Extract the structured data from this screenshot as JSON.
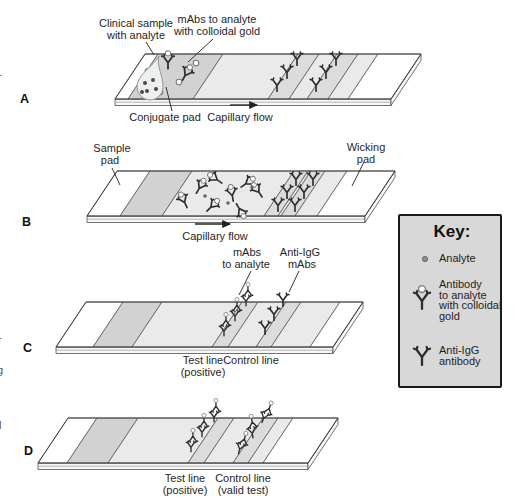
{
  "figure": {
    "panel_a": {
      "letter": "A",
      "clinical_sample_line1": "Clinical sample",
      "clinical_sample_line2": "with analyte",
      "mabs_gold_line1": "mAbs to analyte",
      "mabs_gold_line2": "with colloidal gold",
      "conjugate_pad": "Conjugate pad",
      "capillary_flow": "Capillary flow"
    },
    "panel_b": {
      "letter": "B",
      "sample_pad_line1": "Sample",
      "sample_pad_line2": "pad",
      "wicking_pad_line1": "Wicking",
      "wicking_pad_line2": "pad",
      "capillary_flow": "Capillary flow"
    },
    "panel_c": {
      "letter": "C",
      "mabs_line1": "mAbs",
      "mabs_line2": "to analyte",
      "anti_igg_line1": "Anti-IgG",
      "anti_igg_line2": "mAbs",
      "test_line_line1": "Test line",
      "test_line_line2": "(positive)",
      "control_line": "Control line"
    },
    "panel_d": {
      "letter": "D",
      "test_line_line1": "Test line",
      "test_line_line2": "(positive)",
      "control_line_line1": "Control line",
      "control_line_line2": "(valid test)"
    },
    "key": {
      "title": "Key:",
      "analyte_label": "Analyte",
      "antibody_gold_line1": "Antibody",
      "antibody_gold_line2": "to analyte",
      "antibody_gold_line3": "with colloidal",
      "antibody_gold_line4": "gold",
      "anti_igg_line1": "Anti-IgG",
      "anti_igg_line2": "antibody"
    },
    "edge_text_fragments": {
      "f1": "-",
      "f2": "-",
      "f3": "g",
      "f4": "l"
    }
  },
  "colors": {
    "background": "#ffffff",
    "strip_membrane": "#eaeaea",
    "conjugate_pad": "#d2d2d2",
    "line_band": "#dcdcdc",
    "pad_white": "#ffffff",
    "outline": "#4d4d4d",
    "antibody": "#2e2e2e",
    "gold_fill": "#ffffff",
    "gold_stroke": "#7a7a7a",
    "key_box_fill": "#d8d8d8",
    "key_box_border": "#1a1a1a",
    "text": "#1f1f1f",
    "leader": "#333333"
  }
}
